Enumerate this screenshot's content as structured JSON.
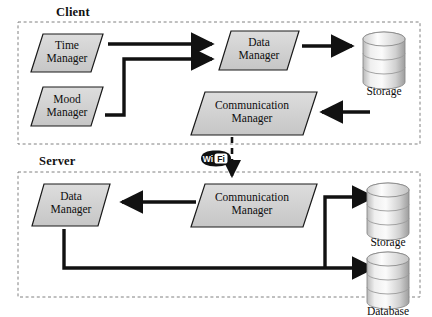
{
  "diagram": {
    "type": "client-server-architecture",
    "zones": [
      {
        "id": "client",
        "label": "Client"
      },
      {
        "id": "server",
        "label": "Server"
      }
    ],
    "client_nodes": [
      {
        "id": "time-manager",
        "line1": "Time",
        "line2": "Manager"
      },
      {
        "id": "mood-manager",
        "line1": "Mood",
        "line2": "Manager"
      },
      {
        "id": "data-manager",
        "line1": "Data",
        "line2": "Manager"
      },
      {
        "id": "communication-manager",
        "line1": "Communication",
        "line2": "Manager"
      }
    ],
    "client_stores": [
      {
        "id": "client-storage",
        "label": "Storage"
      }
    ],
    "server_nodes": [
      {
        "id": "server-data-manager",
        "line1": "Data",
        "line2": "Manager"
      },
      {
        "id": "server-communication-manager",
        "line1": "Communication",
        "line2": "Manager"
      }
    ],
    "server_stores": [
      {
        "id": "server-storage",
        "label": "Storage"
      },
      {
        "id": "server-database",
        "label": "Database"
      }
    ],
    "link": {
      "id": "wifi-link",
      "icon": "wifi-icon",
      "text_left": "Wi",
      "text_right": "Fi",
      "style": "dashed"
    },
    "colors": {
      "node_fill": "#d2d2d2",
      "node_stroke": "#1a1a1a",
      "arrow": "#111111",
      "zone_border": "#777777",
      "cylinder_light": "#f4f4f4",
      "cylinder_mid": "#cfcfcf",
      "cylinder_dark": "#9e9e9e"
    }
  }
}
